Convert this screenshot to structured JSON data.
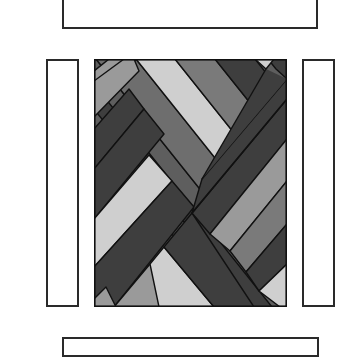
{
  "figure": {
    "top_border": {
      "label": ""
    },
    "bottom_border": {
      "label": ""
    },
    "left_border": {
      "label": ""
    },
    "right_border": {
      "label": ""
    },
    "center_panel": {
      "label": ""
    }
  },
  "colors": {
    "outline": "#111111",
    "light": "#cfcfcf",
    "mid_light": "#9a9a9a",
    "mid": "#7a7a7a",
    "mid_dark": "#5e5e5e",
    "dark": "#3e3e3e",
    "background": "#ffffff"
  }
}
